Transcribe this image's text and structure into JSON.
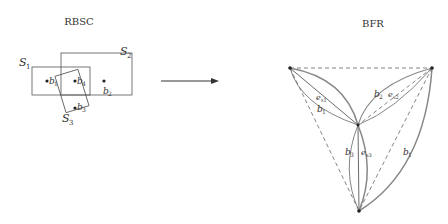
{
  "left_panel": {
    "title": "RBSC",
    "sets": [
      {
        "name": "S",
        "sub": "1"
      },
      {
        "name": "S",
        "sub": "2"
      },
      {
        "name": "S",
        "sub": "3"
      }
    ],
    "points": [
      {
        "name": "b",
        "sub": "1"
      },
      {
        "name": "b",
        "sub": "4"
      },
      {
        "name": "b",
        "sub": "2"
      },
      {
        "name": "b",
        "sub": "3"
      }
    ]
  },
  "arrow": {
    "direction": "right"
  },
  "right_panel": {
    "title": "BFR",
    "edge_labels": [
      {
        "name": "e",
        "sub": "s1",
        "group": "left"
      },
      {
        "name": "b",
        "sub": "1",
        "group": "left"
      },
      {
        "name": "b",
        "sub": "2",
        "group": "right"
      },
      {
        "name": "e",
        "sub": "s2",
        "group": "right"
      },
      {
        "name": "b",
        "sub": "3",
        "group": "bottom"
      },
      {
        "name": "e",
        "sub": "s3",
        "group": "bottom"
      },
      {
        "name": "b",
        "sub": "1",
        "group": "outer-right"
      }
    ]
  },
  "colors": {
    "line": "#555555",
    "thick": "#888888",
    "background": "#ffffff"
  }
}
